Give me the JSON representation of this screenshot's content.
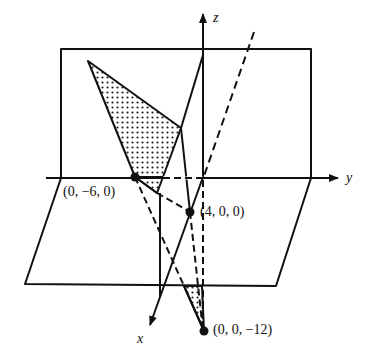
{
  "figure": {
    "axes": {
      "x_label": "x",
      "y_label": "y",
      "z_label": "z"
    },
    "points": [
      {
        "label": "(0, −6, 0)",
        "coords": [
          0,
          -6,
          0
        ]
      },
      {
        "label": "(4, 0, 0)",
        "coords": [
          4,
          0,
          0
        ]
      },
      {
        "label": "(0, 0, −12)",
        "coords": [
          0,
          0,
          -12
        ]
      }
    ],
    "colors": {
      "stroke": "#111111",
      "background": "#ffffff",
      "stipple": "#222222"
    }
  }
}
